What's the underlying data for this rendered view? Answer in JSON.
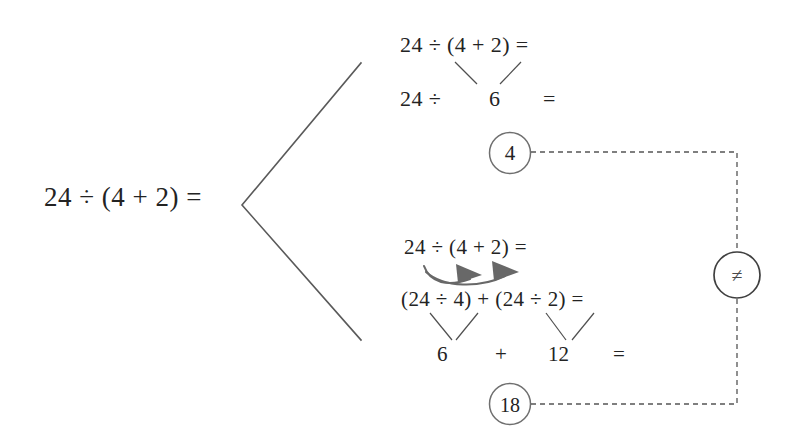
{
  "diagram": {
    "title_expression": "24 ÷ (4 + 2) =",
    "background_color": "#ffffff",
    "text_color": "#232323",
    "line_color": "#5a5a5a",
    "circle_stroke_color": "#6f6f6f",
    "arrow_color": "#686868",
    "dashed_color": "#555555"
  },
  "root": {
    "label": "24 ÷ (4 + 2) ="
  },
  "branch_top": {
    "name": "correct-order-of-operations",
    "line1": "24 ÷ (4 + 2) =",
    "line2_left": "24 ÷",
    "line2_middle": "6",
    "line2_right": "=",
    "result": "4"
  },
  "branch_bottom": {
    "name": "incorrect-distribution",
    "line1": "24 ÷ (4 + 2) =",
    "line2": "(24 ÷ 4) + (24 ÷ 2) =",
    "line3_left": "6",
    "line3_plus": "+",
    "line3_right": "12",
    "line3_equals": "=",
    "result": "18"
  },
  "comparison": {
    "symbol": "≠",
    "icon": "not-equal-icon",
    "connects": [
      "4",
      "18"
    ]
  },
  "icons": {
    "bracket": "angle-bracket-left-icon",
    "distribute_arrow_1": "curved-arrow-icon",
    "distribute_arrow_2": "curved-arrow-icon",
    "converge_lines": "converging-lines-icon"
  }
}
